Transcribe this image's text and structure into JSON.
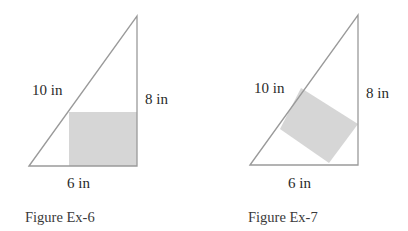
{
  "figures": [
    {
      "id": "ex6",
      "caption": "Figure Ex-6",
      "hypotenuse_label": "10 in",
      "vertical_label": "8 in",
      "base_label": "6 in",
      "description": "Right triangle with square inscribed sharing the right-angle corner"
    },
    {
      "id": "ex7",
      "caption": "Figure Ex-7",
      "hypotenuse_label": "10 in",
      "vertical_label": "8 in",
      "base_label": "6 in",
      "description": "Right triangle with square inscribed having one side on the hypotenuse"
    }
  ],
  "colors": {
    "line": "#9a9a9a",
    "square_fill": "#d6d6d6",
    "text": "#2a2a2a"
  }
}
